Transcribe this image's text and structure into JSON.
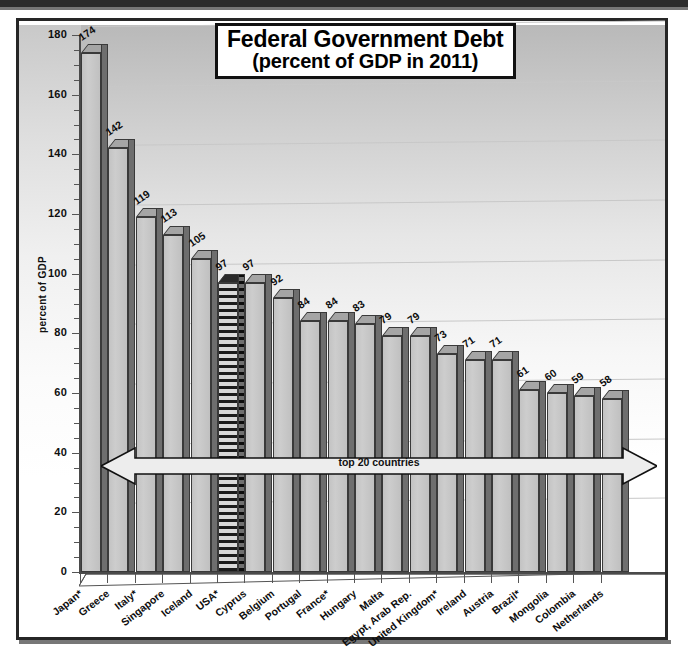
{
  "chart_data": {
    "type": "bar",
    "title": "Federal Government Debt",
    "subtitle": "(percent of GDP in 2011)",
    "xlabel": "",
    "ylabel": "percent of GDP",
    "ylim": [
      0,
      180
    ],
    "ytick_step": 20,
    "yticks": [
      "0",
      "20",
      "40",
      "60",
      "80",
      "100",
      "120",
      "140",
      "160",
      "180"
    ],
    "grid": true,
    "legend": null,
    "annotation": "top 20 countries",
    "highlight_category": "USA*",
    "categories": [
      "Japan*",
      "Greece",
      "Italy*",
      "Singapore",
      "Iceland",
      "USA*",
      "Cyprus",
      "Belgium",
      "Portugal",
      "France*",
      "Hungary",
      "Malta",
      "Egypt, Arab Rep.",
      "United Kingdom*",
      "Ireland",
      "Austria",
      "Brazil*",
      "Mongolia",
      "Colombia",
      "Netherlands"
    ],
    "values": [
      174,
      142,
      119,
      113,
      105,
      97,
      97,
      92,
      84,
      84,
      83,
      79,
      79,
      73,
      71,
      71,
      61,
      60,
      59,
      58
    ],
    "value_labels": [
      "174",
      "142",
      "119",
      "113",
      "105",
      "97",
      "97",
      "92",
      "84",
      "84",
      "83",
      "79",
      "79",
      "73",
      "71",
      "71",
      "61",
      "60",
      "59",
      "58"
    ]
  },
  "colors": {
    "bar_face": "#c7c7c7",
    "bar_side": "#6e6e6e",
    "bar_outline": "#3a3a3a",
    "highlight_pattern": "#1b1b1b",
    "frame": "#262626",
    "gridline": "#c8c8c8",
    "text": "#0d0d0d"
  }
}
